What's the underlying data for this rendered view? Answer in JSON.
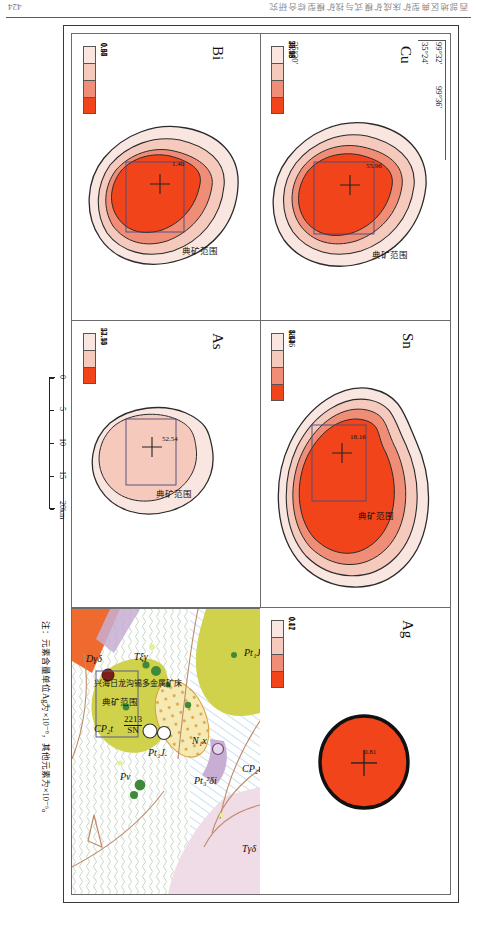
{
  "running_head": {
    "page_number": "424",
    "title": "西部地区典型矿床成矿模式与找矿模型综合研究"
  },
  "figure": {
    "scale_bar": {
      "ticks": [
        "0",
        "5",
        "10",
        "15",
        "20km"
      ],
      "values": [
        0,
        5,
        10,
        15,
        20
      ]
    },
    "note": "注：元素含量单位Ag为×10⁻⁹，其他元素为×10⁻⁶。",
    "coordinates": {
      "lon_left": "99°32′",
      "lon_right": "99°36′",
      "lat_top": "35°24′",
      "lat_bottom": "35°20′",
      "lat_top_deg": "35°",
      "lat_top_min": "24′",
      "lat_bottom_deg": "35°",
      "lat_bottom_min": "20′",
      "lon_left_deg": "99°",
      "lon_left_min": "32′",
      "lon_right_deg": "99°",
      "lon_right_min": "36′"
    },
    "panels": [
      {
        "id": "cu",
        "element": "Cu",
        "mine_range_label": "典矿范围",
        "peak_value": "55.96",
        "legend": {
          "breaks": [
            "28.58",
            "34.43",
            "43.43",
            "55.96"
          ],
          "colors": [
            "#fae6e0",
            "#f6c9bd",
            "#ef8d77",
            "#f2441a"
          ]
        }
      },
      {
        "id": "sn",
        "element": "Sn",
        "mine_range_label": "典矿范围",
        "peak_value": "18.16",
        "legend": {
          "breaks": [
            "4.14",
            "5.64",
            "8.43",
            "18.16"
          ],
          "colors": [
            "#fae6e0",
            "#f6c9bd",
            "#ef8d77",
            "#f2441a"
          ]
        }
      },
      {
        "id": "ag",
        "element": "Ag",
        "mine_range_label": "典矿范围",
        "peak_value": "0.81",
        "legend": {
          "breaks": [
            "0.11",
            "0.12",
            "0.17",
            "0.81"
          ],
          "colors": [
            "#fae6e0",
            "#f6c9bd",
            "#ef8d77",
            "#f2441a"
          ]
        }
      },
      {
        "id": "bi",
        "element": "Bi",
        "mine_range_label": "典矿范围",
        "peak_value": "1.40",
        "legend": {
          "breaks": [
            "0.55",
            "0.87",
            "0.94",
            "1.40"
          ],
          "colors": [
            "#fae6e0",
            "#f6c9bd",
            "#ef8d77",
            "#f2441a"
          ]
        }
      },
      {
        "id": "as",
        "element": "As",
        "mine_range_label": "典矿范围",
        "peak_value": "52.54",
        "legend": {
          "breaks": [
            "27.40",
            "44.15",
            "52.54"
          ],
          "colors": [
            "#fae6e0",
            "#f6c9bd",
            "#f2441a"
          ]
        }
      }
    ],
    "geomap": {
      "mine_range_label": "典矿范围",
      "deposit_name": "兴海日龙沟锡多金属矿床",
      "deposit_code_top": "2213",
      "deposit_code_bottom": "SN",
      "units": [
        {
          "label": "Pt₁J.",
          "main": "Pt",
          "sub": "1",
          "suffix": "J."
        },
        {
          "label": "CP₂t",
          "main": "CP",
          "sub": "2",
          "suffix": "t"
        },
        {
          "label": "Tγδ",
          "main": "T",
          "suffix": "γδ"
        },
        {
          "label": "Pt₃²δi",
          "main": "Pt",
          "sub": "3",
          "sup": "2",
          "suffix": "δi"
        },
        {
          "label": "N₁x",
          "main": "N",
          "sub": "1",
          "suffix": "x"
        },
        {
          "label": "Pt₁J.",
          "main": "Pt",
          "sub": "1",
          "suffix": "J."
        },
        {
          "label": "Pν",
          "main": "P",
          "suffix": "ν"
        },
        {
          "label": "CP₂t",
          "main": "CP",
          "sub": "2",
          "suffix": "t"
        },
        {
          "label": "Dγδ",
          "main": "D",
          "suffix": "γδ"
        },
        {
          "label": "Tξγ",
          "main": "T",
          "sub": "ξ",
          "suffix": "γ"
        }
      ],
      "colors": {
        "green_unit": "#cfd24a",
        "pink_unit": "#f0dce6",
        "orange_unit": "#ef6a2e",
        "yellow_unit": "#f6eab4",
        "purple_unit": "#c7aed2",
        "dot_dark": "#7d1f16",
        "dot_green": "#3f8a3a"
      }
    }
  }
}
